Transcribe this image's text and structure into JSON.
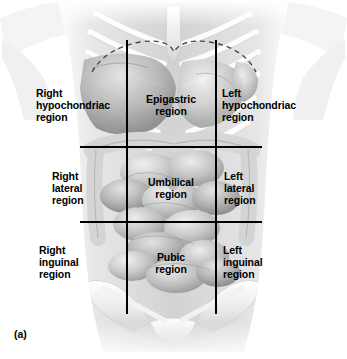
{
  "figure": {
    "caption": "(a)",
    "illustration_name": "anterior-abdominal-torso-grayscale"
  },
  "grid": {
    "line_color": "#000000",
    "vertical_lines": [
      {
        "name": "left-midclavicular-line",
        "x": 126,
        "y_top": 40,
        "y_bottom": 314
      },
      {
        "name": "right-midclavicular-line",
        "x": 215,
        "y_top": 40,
        "y_bottom": 314
      }
    ],
    "horizontal_lines": [
      {
        "name": "subcostal-line",
        "y": 146,
        "x_start": 80,
        "x_end": 262
      },
      {
        "name": "intertubercular-line",
        "y": 221,
        "x_start": 80,
        "x_end": 262
      }
    ],
    "diaphragm_outline": {
      "name": "diaphragm-dashed-curve",
      "style": "dashed",
      "color": "#3a3a3a"
    }
  },
  "regions": [
    {
      "id": "right-hypochondriac",
      "label": "Right\nhypochondriac\nregion",
      "row": "upper",
      "column": "right",
      "x": 36,
      "y": 87,
      "align": "left"
    },
    {
      "id": "epigastric",
      "label": "Epigastric\nregion",
      "row": "upper",
      "column": "center",
      "x": 136,
      "y": 93,
      "align": "center"
    },
    {
      "id": "left-hypochondriac",
      "label": "Left\nhypochondriac\nregion",
      "row": "upper",
      "column": "left",
      "x": 222,
      "y": 87,
      "align": "left"
    },
    {
      "id": "right-lateral",
      "label": "Right\nlateral\nregion",
      "row": "middle",
      "column": "right",
      "x": 52,
      "y": 170,
      "align": "left"
    },
    {
      "id": "umbilical",
      "label": "Umbilical\nregion",
      "row": "middle",
      "column": "center",
      "x": 138,
      "y": 176,
      "align": "center"
    },
    {
      "id": "left-lateral",
      "label": "Left\nlateral\nregion",
      "row": "middle",
      "column": "left",
      "x": 224,
      "y": 170,
      "align": "left"
    },
    {
      "id": "right-inguinal",
      "label": "Right\ninguinal\nregion",
      "row": "lower",
      "column": "right",
      "x": 39,
      "y": 244,
      "align": "left"
    },
    {
      "id": "pubic",
      "label": "Pubic\nregion",
      "row": "lower",
      "column": "center",
      "x": 143,
      "y": 251,
      "align": "center"
    },
    {
      "id": "left-inguinal",
      "label": "Left\ninguinal\nregion",
      "row": "lower",
      "column": "left",
      "x": 223,
      "y": 244,
      "align": "left"
    }
  ]
}
